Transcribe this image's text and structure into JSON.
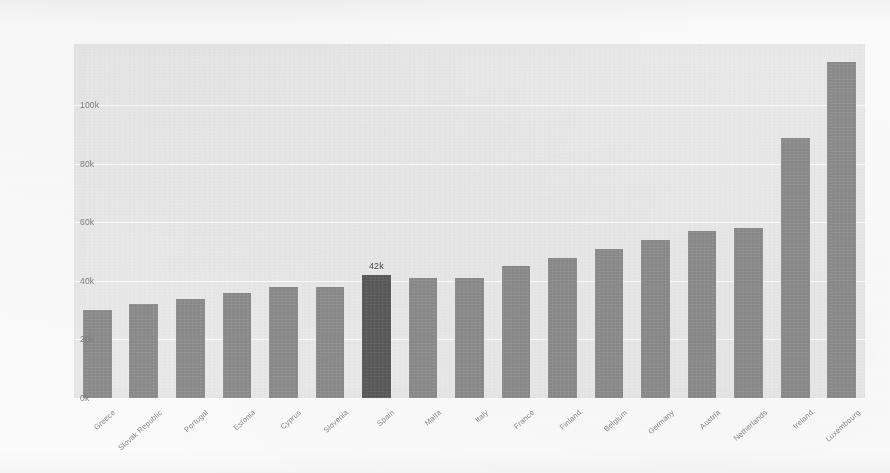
{
  "chart_data": {
    "type": "bar",
    "title": "",
    "subtitle": "",
    "xlabel": "",
    "ylabel": "",
    "ylim": [
      0,
      121000
    ],
    "grid": true,
    "legend": null,
    "legend_position": "none",
    "y_ticks": [
      {
        "value": 0,
        "label": "0k"
      },
      {
        "value": 20000,
        "label": "20k"
      },
      {
        "value": 40000,
        "label": "40k"
      },
      {
        "value": 60000,
        "label": "60k"
      },
      {
        "value": 80000,
        "label": "80k"
      },
      {
        "value": 100000,
        "label": "100k"
      }
    ],
    "categories": [
      "Greece",
      "Slovak Republic",
      "Portugal",
      "Estonia",
      "Cyprus",
      "Slovenia",
      "Spain",
      "Malta",
      "Italy",
      "France",
      "Finland",
      "Belgium",
      "Germany",
      "Austria",
      "Netherlands",
      "Ireland",
      "Luxembourg"
    ],
    "values": [
      30000,
      32000,
      34000,
      36000,
      38000,
      38000,
      42000,
      41000,
      41000,
      45000,
      48000,
      51000,
      54000,
      57000,
      58000,
      89000,
      115000
    ],
    "highlight_index": 6,
    "data_labels": [
      null,
      null,
      null,
      null,
      null,
      null,
      "42k",
      null,
      null,
      null,
      null,
      null,
      null,
      null,
      null,
      null,
      null
    ],
    "colors": {
      "bar": "#8f8f8f",
      "bar_highlight": "#5c5c5c",
      "plot_background": "#ececec",
      "page_background": "#fdfdfd",
      "gridline": "#ffffff",
      "tick_text": "#7d7d7d",
      "category_text": "#8b8b8b",
      "value_label_text": "#4a4a4a"
    }
  }
}
